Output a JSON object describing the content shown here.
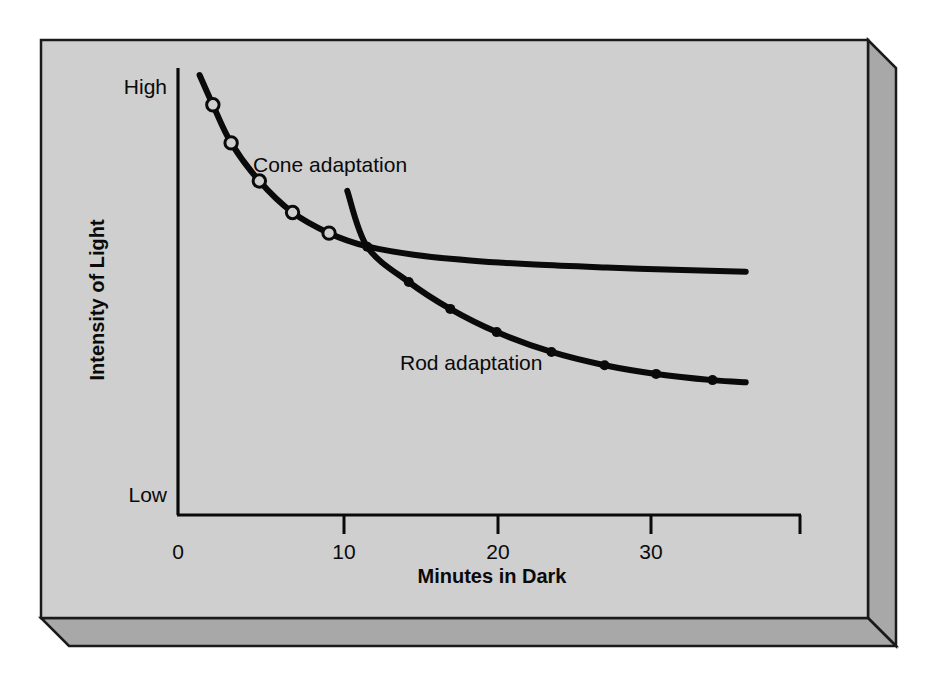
{
  "figure": {
    "panel_fill": "#cfcfcf",
    "bevel_fill": "#a8a8a8",
    "outline_color": "#1a1a1a",
    "ink_color": "#0a0a0a",
    "marker_open_fill": "#cfcfcf"
  },
  "chart_data": {
    "type": "line",
    "title": "",
    "xlabel": "Minutes in Dark",
    "ylabel": "Intensity of Light",
    "xlim": [
      0,
      40.5
    ],
    "ylim": [
      0,
      1
    ],
    "xticks": [
      0,
      10,
      20,
      30
    ],
    "xticklabels": [
      "0",
      "10",
      "20",
      "30"
    ],
    "yticklabels": [
      "High",
      "Low"
    ],
    "ytick_high_label": "High",
    "ytick_low_label": "Low",
    "grid": false,
    "legend_position": "inline-annotations",
    "annotations": [
      {
        "text": "Cone adaptation",
        "x": 10.2,
        "y": 0.845
      },
      {
        "text": "Rod adaptation",
        "x": 16.8,
        "y": 0.425
      }
    ],
    "series": [
      {
        "name": "Cone adaptation",
        "marker": "open-circle",
        "color": "#0a0a0a",
        "x": [
          1.3,
          2.1,
          3.2,
          4.9,
          6.9,
          9.1,
          11.4,
          14.2,
          17.6,
          21.5,
          25.8,
          30.4,
          34.2
        ],
        "y": [
          1.0,
          0.928,
          0.836,
          0.744,
          0.668,
          0.618,
          0.586,
          0.566,
          0.552,
          0.542,
          0.535,
          0.529,
          0.525
        ],
        "marker_x": [
          2.1,
          3.2,
          4.9,
          6.9,
          9.1
        ],
        "marker_y": [
          0.928,
          0.836,
          0.744,
          0.668,
          0.618
        ]
      },
      {
        "name": "Rod adaptation",
        "marker": "filled-circle",
        "color": "#0a0a0a",
        "x": [
          10.2,
          11.4,
          13.9,
          16.4,
          19.2,
          22.5,
          25.7,
          28.8,
          32.2,
          34.2
        ],
        "y": [
          0.72,
          0.585,
          0.5,
          0.435,
          0.379,
          0.331,
          0.299,
          0.278,
          0.263,
          0.258
        ],
        "marker_x": [
          11.4,
          13.9,
          16.4,
          19.2,
          22.5,
          25.7,
          28.8,
          32.2
        ],
        "marker_y": [
          0.585,
          0.5,
          0.435,
          0.379,
          0.331,
          0.299,
          0.278,
          0.263
        ]
      }
    ]
  }
}
